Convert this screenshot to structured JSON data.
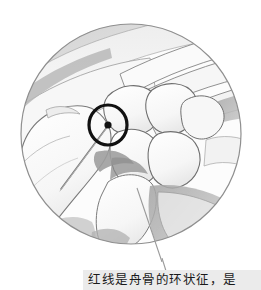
{
  "page": {
    "background_color": "#ffffff",
    "width": 261,
    "height": 290
  },
  "illustration": {
    "name": "carpal-bones-ring-sign-illustration",
    "shape": "circular-vignette",
    "subject": "wrist carpal bones anatomical line drawing",
    "circle": {
      "center_x": 131,
      "center_y": 134,
      "radius": 110,
      "outline_color": "#8c8c8c",
      "fill_color": "#fdfdfd"
    },
    "marker": {
      "name": "ring-sign-marker",
      "type": "ring-with-center-dot",
      "center_x": 108,
      "center_y": 125,
      "outer_rx": 19,
      "outer_ry": 20,
      "stroke_color": "#111111",
      "dot_color": "#111111",
      "label": "scaphoid ring sign"
    },
    "pointer_line": {
      "name": "ring-sign-pointer-line",
      "from_x": 108,
      "from_y": 127,
      "to_x": 62,
      "to_y": 188,
      "color": "#7d7d7d"
    },
    "leader_line": {
      "name": "caption-leader-line",
      "from_x": 137,
      "from_y": 190,
      "to_x": 162,
      "to_y": 268,
      "color": "#9a9a9a"
    },
    "palette": {
      "bone_light": "#fbfbfb",
      "bone_fill": "#f4f4f4",
      "bone_outline": "#6f6f6f",
      "soft_tissue_gray": "#d9d9d9",
      "shadow_gray": "#a9a9a9",
      "deep_gray": "#9b9b9b",
      "background": "#ffffff"
    }
  },
  "caption": {
    "name": "figure-caption",
    "text": "红线是舟骨的环状征，是",
    "background_color": "#ebebeb",
    "text_color": "#1a1a1a"
  }
}
